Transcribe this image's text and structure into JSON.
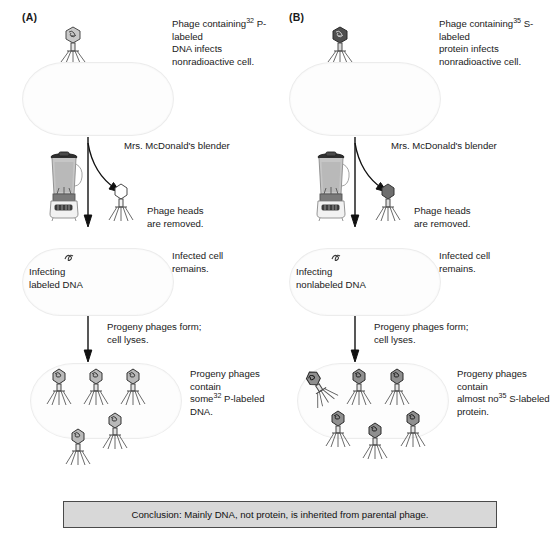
{
  "figure": {
    "panels": [
      {
        "label": "(A)",
        "steps": [
          {
            "name": "infection",
            "text_pre": "Phage containing",
            "sup": "32",
            "text_post": " P-labeled\nDNA infects nonradioactive cell."
          },
          {
            "name": "blender",
            "text": "Mrs. McDonald's blender"
          },
          {
            "name": "heads-removed",
            "text": "Phage heads\nare removed."
          },
          {
            "name": "infected-cell",
            "text": "Infected cell\nremains."
          },
          {
            "name": "cell-contents",
            "text": "Infecting\nlabeled DNA"
          },
          {
            "name": "lysis",
            "text": "Progeny phages form;\ncell lyses."
          },
          {
            "name": "progeny",
            "text_pre": "Progeny phages contain\nsome",
            "sup": "32",
            "text_post": " P-labeled DNA."
          }
        ],
        "phage_head_style": "dna-coil",
        "removed_head_fill": "empty",
        "progeny_count": 5
      },
      {
        "label": "(B)",
        "steps": [
          {
            "name": "infection",
            "text_pre": "Phage containing",
            "sup": "35",
            "text_post": " S-labeled\nprotein infects nonradioactive cell."
          },
          {
            "name": "blender",
            "text": "Mrs. McDonald's blender"
          },
          {
            "name": "heads-removed",
            "text": "Phage heads\nare removed."
          },
          {
            "name": "infected-cell",
            "text": "Infected cell\nremains."
          },
          {
            "name": "cell-contents",
            "text": "Infecting\nnonlabeled DNA"
          },
          {
            "name": "lysis",
            "text": "Progeny phages form;\ncell lyses."
          },
          {
            "name": "progeny",
            "text_pre": "Progeny phages contain\nalmost no",
            "sup": "35",
            "text_post": " S-labeled\nprotein."
          }
        ],
        "phage_head_style": "dark-filled",
        "removed_head_fill": "dark",
        "progeny_count": 6
      }
    ],
    "conclusion": "Conclusion:  Mainly DNA, not protein, is inherited from parental phage.",
    "colors": {
      "ink": "#1a1a1a",
      "cell_outline": "#ececec",
      "cell_fill": "#fdfdfd",
      "conclusion_fill": "#d8d8d8",
      "conclusion_border": "#4a4a4a",
      "phage_dark": "#4f4f4f",
      "blender_liquid": "#b9b9b9"
    },
    "icons": {
      "phage": "bacteriophage-icon",
      "blender": "blender-icon",
      "dna": "dna-coil-icon",
      "arrow": "down-arrow-icon",
      "curved_arrow": "curved-arrow-icon"
    }
  }
}
